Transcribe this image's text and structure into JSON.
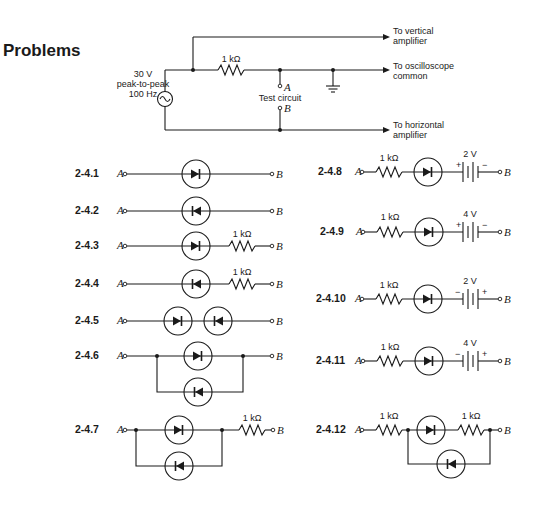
{
  "page": {
    "heading": "Problems"
  },
  "test_setup": {
    "source": {
      "line1": "30 V",
      "line2": "peak-to-peak",
      "line3": "100 Hz"
    },
    "resistor": "1 kΩ",
    "terminal_a": "A",
    "terminal_b": "B",
    "test_label": "Test circuit",
    "out_vertical": {
      "line1": "To vertical",
      "line2": "amplifier"
    },
    "out_common": {
      "line1": "To oscilloscope",
      "line2": "common"
    },
    "out_horizontal": {
      "line1": "To horizontal",
      "line2": "amplifier"
    }
  },
  "problems": [
    {
      "id": "2-4.1",
      "a": "A",
      "b": "B"
    },
    {
      "id": "2-4.2",
      "a": "A",
      "b": "B"
    },
    {
      "id": "2-4.3",
      "a": "A",
      "b": "B",
      "r": "1 kΩ"
    },
    {
      "id": "2-4.4",
      "a": "A",
      "b": "B",
      "r": "1 kΩ"
    },
    {
      "id": "2-4.5",
      "a": "A",
      "b": "B"
    },
    {
      "id": "2-4.6",
      "a": "A",
      "b": "B"
    },
    {
      "id": "2-4.7",
      "a": "A",
      "b": "B",
      "r": "1 kΩ"
    },
    {
      "id": "2-4.8",
      "a": "A",
      "b": "B",
      "r": "1 kΩ",
      "v": "2 V",
      "plus": "+",
      "minus": "−"
    },
    {
      "id": "2-4.9",
      "a": "A",
      "b": "B",
      "r": "1 kΩ",
      "v": "4 V",
      "plus": "+",
      "minus": "−"
    },
    {
      "id": "2-4.10",
      "a": "A",
      "b": "B",
      "r": "1 kΩ",
      "v": "2 V",
      "plus": "+",
      "minus": "−"
    },
    {
      "id": "2-4.11",
      "a": "A",
      "b": "B",
      "r": "1 kΩ",
      "v": "4 V",
      "plus": "+",
      "minus": "−"
    },
    {
      "id": "2-4.12",
      "a": "A",
      "b": "B",
      "r": "1 kΩ",
      "r2": "1 kΩ"
    }
  ]
}
